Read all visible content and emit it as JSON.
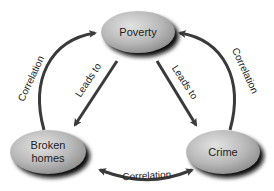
{
  "diagram": {
    "nodes": [
      {
        "id": "poverty",
        "label": "Poverty"
      },
      {
        "id": "broken_homes",
        "label_line1": "Broken",
        "label_line2": "homes"
      },
      {
        "id": "crime",
        "label": "Crime"
      }
    ],
    "edges": [
      {
        "from": "broken_homes",
        "to": "poverty",
        "label": "Correlation",
        "type": "curved"
      },
      {
        "from": "crime",
        "to": "poverty",
        "label": "Correlation",
        "type": "curved"
      },
      {
        "from": "crime",
        "to": "broken_homes",
        "label": "Correlation",
        "type": "curved",
        "bidirectional": true
      },
      {
        "from": "poverty",
        "to": "broken_homes",
        "label": "Leads to",
        "type": "straight"
      },
      {
        "from": "poverty",
        "to": "crime",
        "label": "Leads to",
        "type": "straight"
      }
    ],
    "colors": {
      "node_fill_light": "#d8d8d8",
      "node_fill_dark": "#9a9a9a",
      "node_shadow": "#1a1a1a",
      "arrow": "#3a3a3a"
    }
  }
}
